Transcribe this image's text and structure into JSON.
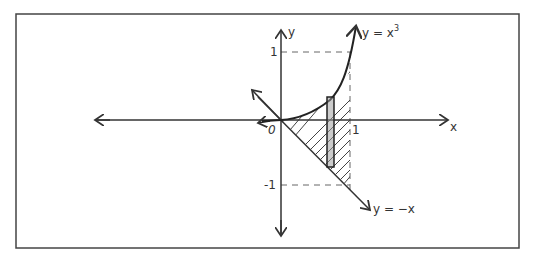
{
  "diagram": {
    "type": "hand-drawn region between curves",
    "labels": {
      "x_axis": "x",
      "y_axis": "y",
      "origin": "0",
      "x_tick_1": "1",
      "y_tick_1": "1",
      "y_tick_neg1": "-1",
      "curve_upper": "y = x",
      "curve_upper_exp": "3",
      "curve_lower": "y = −x"
    },
    "curves": [
      {
        "name": "y = x^3",
        "role": "upper boundary"
      },
      {
        "name": "y = -x",
        "role": "lower boundary"
      }
    ],
    "shaded_region": {
      "x_from": 0,
      "x_to": 1,
      "between": [
        "y = x^3",
        "y = -x"
      ]
    },
    "representative_rectangle": {
      "x_approx": 0.7
    },
    "colors": {
      "ink": "#333333",
      "paper": "#ffffff"
    }
  }
}
